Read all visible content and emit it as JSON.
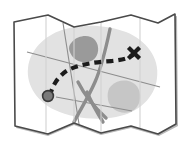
{
  "illustration": {
    "title": "Folded route map with dashed trail and X destination marker",
    "kind": "map-icon",
    "canvas": {
      "width": 190,
      "height": 156
    },
    "background_color": "#ffffff"
  },
  "colors": {
    "paper_fill": "#ffffff",
    "paper_outline": "#4a4a4a",
    "paper_shadow": "#b8b8b8",
    "fold_line": "#d2d2d2",
    "landmass_fill": "#e2e2e2",
    "lake_dark_fill": "#9a9a9a",
    "lake_mid_fill": "#c6c6c6",
    "road_major": "#8d8d8d",
    "road_minor": "#8d8d8d",
    "trail": "#1c1c1c",
    "marker_x": "#1c1c1c",
    "start_dot": "#7a7a7a",
    "start_dot_outline": "#3a3a3a"
  },
  "paper": {
    "name": "folded-paper-sheet",
    "outline_path": "M 14 22 L 48 15 L 74 27 L 101 22 L 131 15 L 158 23 L 175 14 L 176 124 L 158 134 L 131 126 L 101 133 L 74 123 L 48 134 L 15 126 Z",
    "shadow_path": "M 177 16 L 178 126 L 159 136 L 131 128 L 101 135 L 74 125 L 48 136 L 16 128 L 17 125 L 48 133 L 74 122 L 101 132 L 131 125 L 158 133 L 175 123 L 174 17 Z",
    "fold_lines": [
      {
        "name": "fold-line-1",
        "x1": 46,
        "y1": 16,
        "x2": 46,
        "y2": 132
      },
      {
        "name": "fold-line-2",
        "x1": 74,
        "y1": 27,
        "x2": 74,
        "y2": 123
      },
      {
        "name": "fold-line-3",
        "x1": 101,
        "y1": 23,
        "x2": 101,
        "y2": 132
      },
      {
        "name": "fold-line-4",
        "x1": 140,
        "y1": 18,
        "x2": 140,
        "y2": 130
      }
    ]
  },
  "terrain": {
    "landmass": {
      "name": "landmass-region",
      "path": "M 62 30 C 82 23 108 25 126 32 C 146 40 160 58 157 78 C 155 98 138 113 116 117 C 96 121 72 118 55 110 C 38 102 26 86 28 68 C 30 50 44 36 62 30 Z"
    },
    "lakes": [
      {
        "name": "lake-upper",
        "tone": "dark",
        "path": "M 72 42 C 78 35 90 34 95 40 C 100 46 99 56 93 60 C 86 64 76 62 72 56 C 68 50 68 46 72 42 Z"
      },
      {
        "name": "lake-lower",
        "tone": "mid",
        "path": "M 111 86 C 119 78 133 79 138 88 C 143 97 139 109 130 112 C 120 115 110 109 108 100 C 107 94 108 89 111 86 Z"
      }
    ]
  },
  "roads": {
    "major_curves": [
      {
        "name": "road-curve-main",
        "path": "M 110 29 C 106 48 102 66 95 82 C 88 98 80 110 74 122"
      },
      {
        "name": "road-curve-branch",
        "path": "M 78 82 C 84 94 93 106 106 118"
      },
      {
        "name": "road-curve-lower",
        "path": "M 87 92 C 92 104 98 114 103 122"
      }
    ],
    "minor_lines": [
      {
        "name": "road-straight-diagonal",
        "x1": 27,
        "y1": 52,
        "x2": 160,
        "y2": 87
      },
      {
        "name": "road-straight-vertical",
        "x1": 63,
        "y1": 23,
        "x2": 79,
        "y2": 124
      },
      {
        "name": "road-straight-short",
        "x1": 56,
        "y1": 97,
        "x2": 132,
        "y2": 111
      }
    ]
  },
  "route": {
    "name": "dashed-trail",
    "path": "M 50 96 C 52 86 58 76 68 70 C 80 64 96 62 112 61 C 122 60 130 58 134 54",
    "dash_pattern": "7 5",
    "stroke_width": 4.2,
    "start_point": {
      "name": "route-start-dot",
      "cx": 48,
      "cy": 96,
      "r": 5.4
    },
    "destination_marker": {
      "name": "route-destination-x",
      "label": "X",
      "cx": 134,
      "cy": 53,
      "arm": 5.6,
      "stroke_width": 4.2
    }
  }
}
